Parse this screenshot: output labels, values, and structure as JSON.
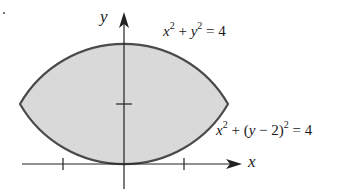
{
  "figure": {
    "axes": {
      "x_label": "x",
      "y_label": "y",
      "x_ticks": [
        -1,
        1
      ],
      "y_ticks": [
        1
      ]
    },
    "curves": [
      {
        "name": "circle-1",
        "label_base": "x",
        "label_mid": " + ",
        "label_y": "y",
        "label_end": " = 4",
        "equation": "x^2 + y^2 = 4"
      },
      {
        "name": "circle-2",
        "label_base": "x",
        "label_mid": " + (",
        "label_y": "y",
        "label_mid2": " − 2)",
        "label_end": " = 4",
        "equation": "x^2 + (y - 2)^2 = 4"
      }
    ],
    "colors": {
      "fill": "#d9d9d9",
      "stroke": "#4a4a4a",
      "axis": "#222222"
    }
  }
}
